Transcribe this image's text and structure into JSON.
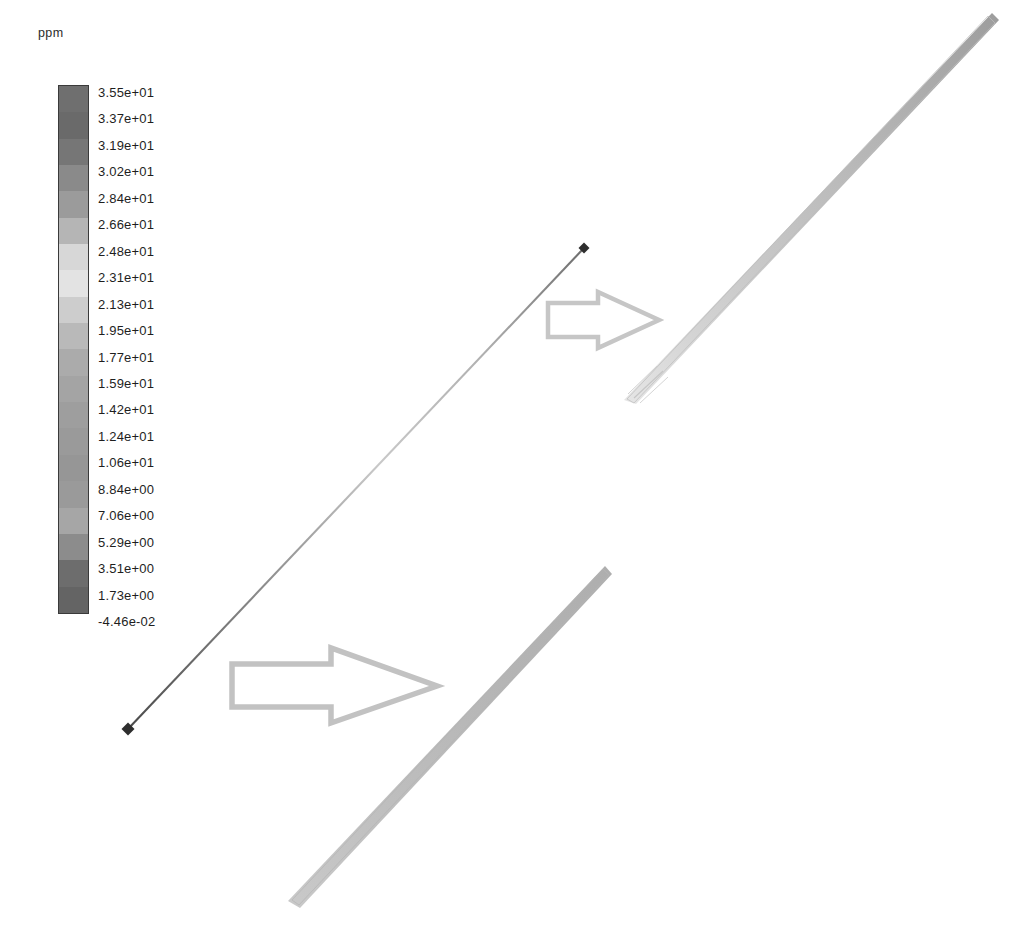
{
  "figure": {
    "width": 1026,
    "height": 925,
    "background": "#ffffff",
    "unit_label": "ppm",
    "line_color": "#3c3c3c",
    "arrow_color": "#c0c0c0",
    "band_color_light": "#cfcfcf",
    "band_color_mid": "#a8a8a8"
  },
  "legend": {
    "unit": "ppm",
    "title": "ppm",
    "orientation": "vertical",
    "tick_count": 21,
    "max_value": "3.55e+01",
    "min_value": "-4.46e-02",
    "ticks": [
      "3.55e+01",
      "3.37e+01",
      "3.19e+01",
      "3.02e+01",
      "2.84e+01",
      "2.66e+01",
      "2.48e+01",
      "2.31e+01",
      "2.13e+01",
      "1.95e+01",
      "1.77e+01",
      "1.59e+01",
      "1.42e+01",
      "1.24e+01",
      "1.06e+01",
      "8.84e+00",
      "7.06e+00",
      "5.29e+00",
      "3.51e+00",
      "1.73e+00",
      "-4.46e-02"
    ],
    "band_colors": [
      "#6f6f6f",
      "#6a6a6a",
      "#767676",
      "#8a8a8a",
      "#9b9b9b",
      "#b5b5b5",
      "#d7d7d7",
      "#e3e3e3",
      "#cdcdcd",
      "#b9b9b9",
      "#ababab",
      "#a4a4a4",
      "#9e9e9e",
      "#9a9a9a",
      "#969696",
      "#9a9a9a",
      "#a6a6a6",
      "#8c8c8c",
      "#6d6d6d",
      "#646464"
    ]
  },
  "chart_data": {
    "type": "heatmap",
    "title": "ppm",
    "subtitle": "",
    "xlabel": "",
    "ylabel": "",
    "colorbar_label": "ppm",
    "colorbar_ticks": [
      35.5,
      33.7,
      31.9,
      30.2,
      28.4,
      26.6,
      24.8,
      23.1,
      21.3,
      19.5,
      17.7,
      15.9,
      14.2,
      12.4,
      10.6,
      8.84,
      7.06,
      5.29,
      3.51,
      1.73,
      -0.0446
    ],
    "colorbar_range": [
      -0.0446,
      35.5
    ],
    "grid": false,
    "legend_position": "left",
    "annotations": [
      {
        "name": "reference-line",
        "kind": "line-with-endpoint-markers",
        "x1": 128,
        "y1": 729,
        "x2": 584,
        "y2": 248
      },
      {
        "name": "callout-arrow-lower",
        "kind": "block-arrow",
        "direction": "right",
        "x": 230,
        "y": 650,
        "width": 208,
        "height": 72
      },
      {
        "name": "callout-arrow-upper",
        "kind": "block-arrow",
        "direction": "right",
        "x": 545,
        "y": 292,
        "width": 116,
        "height": 56
      },
      {
        "name": "contour-band-upper-right",
        "kind": "diagonal-contour-band",
        "x1": 625,
        "y1": 400,
        "x2": 992,
        "y2": 18
      },
      {
        "name": "contour-band-lower-right",
        "kind": "diagonal-contour-band",
        "x1": 293,
        "y1": 903,
        "x2": 607,
        "y2": 570
      }
    ]
  }
}
